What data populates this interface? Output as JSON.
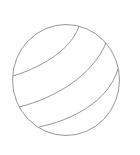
{
  "image": {
    "subject": "ball-line-drawing",
    "description": "Outline drawing of a ball with three curved stripes",
    "stroke_color": "#8a8a8a",
    "background_color": "#ffffff"
  }
}
